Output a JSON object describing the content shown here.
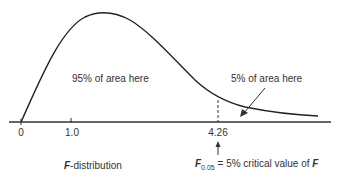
{
  "diagram": {
    "type": "F-distribution density curve",
    "axis": {
      "ticks": [
        {
          "label": "0",
          "x": 21
        },
        {
          "label": "1.0",
          "x": 71
        },
        {
          "label": "4.26",
          "x": 218
        }
      ]
    },
    "area_labels": {
      "left": "95% of area here",
      "right": "5% of area here"
    },
    "caption_left": {
      "italic": "F",
      "rest": "-distribution"
    },
    "caption_right": {
      "symbol": "F",
      "subscript": "0.05",
      "rest": " = 5% critical value of ",
      "symbol_end": "F"
    },
    "critical_value": "4.26",
    "colors": {
      "line": "#222222",
      "text": "#333333",
      "background": "#ffffff"
    }
  }
}
